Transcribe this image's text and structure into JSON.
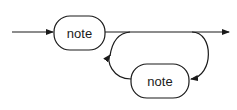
{
  "diagram": {
    "type": "syntax-diagram",
    "colors": {
      "stroke": "#1a1a1a",
      "background": "#ffffff"
    },
    "nodes": [
      {
        "id": "top",
        "label": "note"
      },
      {
        "id": "loop",
        "label": "note"
      }
    ]
  }
}
